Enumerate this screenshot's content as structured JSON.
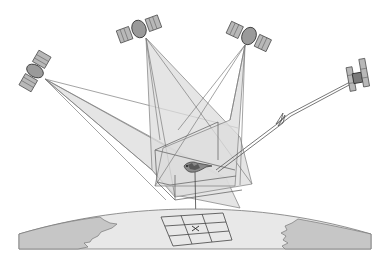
{
  "diagram": {
    "title": "",
    "colors": {
      "background": "#ffffff",
      "beam_fill": "#d9d9d9",
      "beam_stroke": "#7a7a7a",
      "satellite_body": "#9a9a9a",
      "satellite_panel": "#b5b5b5",
      "ground_fill": "#e6e6e6",
      "land_fill": "#c4c4c4",
      "line": "#555555"
    },
    "satellites": [
      {
        "id": "sat-left",
        "label": "",
        "role": "positioning"
      },
      {
        "id": "sat-top-center",
        "label": "",
        "role": "positioning"
      },
      {
        "id": "sat-top-right",
        "label": "",
        "role": "positioning"
      },
      {
        "id": "sat-right",
        "label": "",
        "role": "communications"
      }
    ],
    "bird": {
      "label": "",
      "has_transmitter": true
    },
    "ground": {
      "grid": "3x3",
      "marker": "x"
    }
  }
}
